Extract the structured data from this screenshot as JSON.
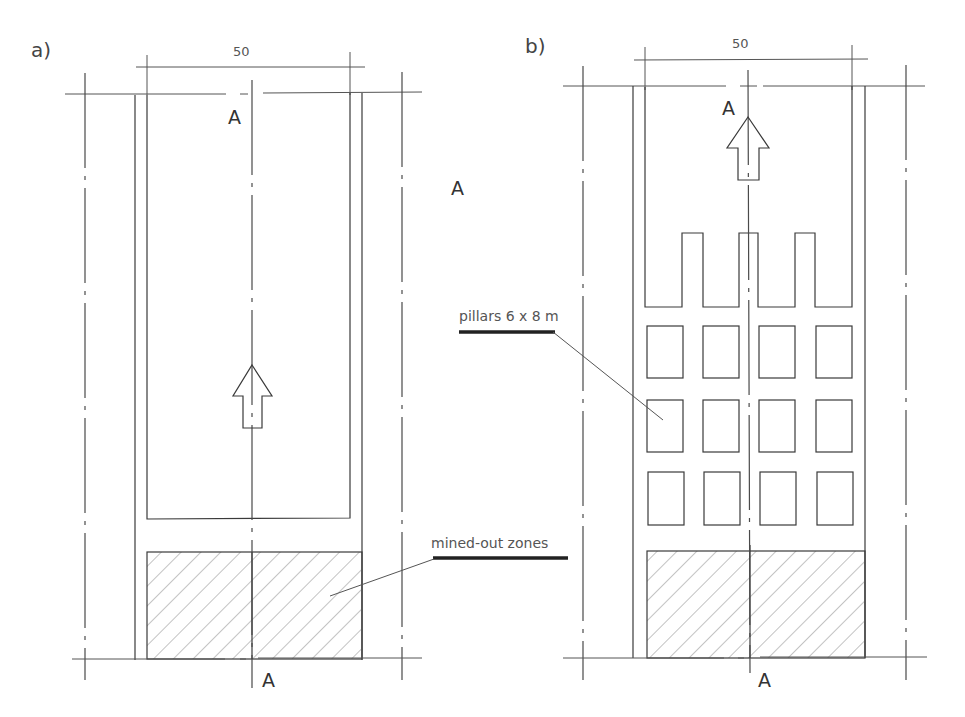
{
  "figure": {
    "panels": [
      {
        "id": "a",
        "label": "a)",
        "dimension": "50",
        "section_top": "A",
        "section_bottom": "A",
        "description": "single open stope advancing upward, mined-out zone hatched at bottom"
      },
      {
        "id": "b",
        "label": "b)",
        "dimension": "50",
        "section_top": "A",
        "section_bottom": "A",
        "description": "room-and-pillar advance with 3 rows x 4 pillars, mined-out zone hatched at bottom",
        "pillar_grid": {
          "rows": 3,
          "cols": 4
        }
      }
    ],
    "floating_section_label": "A",
    "callouts": {
      "pillars": "pillars 6 x 8 m",
      "mined_out": "mined-out zones"
    },
    "icons": {
      "advance_arrow": "up-arrow-icon"
    },
    "colors": {
      "line": "#3a3a3a",
      "text": "#555555",
      "background": "#ffffff"
    }
  }
}
